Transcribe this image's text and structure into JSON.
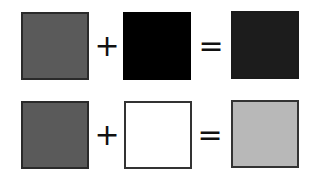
{
  "rows": [
    {
      "left_color": "#5a5a5a",
      "operator_plus": "+",
      "middle_color": "#000000",
      "operator_equals": "=",
      "result_color": "#1c1c1c"
    },
    {
      "left_color": "#5a5a5a",
      "operator_plus": "+",
      "middle_color": "#ffffff",
      "operator_equals": "=",
      "result_color": "#b8b8b8"
    }
  ]
}
